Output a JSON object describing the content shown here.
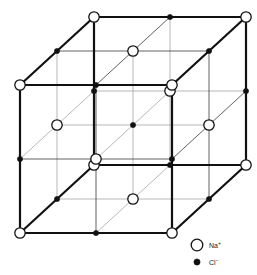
{
  "figure": {
    "background_color": "#ffffff"
  },
  "geometry": {
    "origin_x": 20,
    "origin_y": 233,
    "x_step": 76,
    "y_step": 74,
    "depth_dx": 37,
    "depth_dy": -34,
    "steps": 2
  },
  "style": {
    "outer_edge_color": "#111111",
    "outer_edge_width": 2.2,
    "inner_edge_color": "#3a3a3a",
    "inner_edge_width": 0.8,
    "faint_edge_color": "#9a9a9a",
    "faint_edge_width": 0.7,
    "na_fill": "#ffffff",
    "na_stroke": "#111111",
    "na_radius": 5.2,
    "na_stroke_width": 1.3,
    "cl_fill": "#111111",
    "cl_stroke": "#111111",
    "cl_radius": 2.6
  },
  "ions": {
    "na": {
      "symbol": "Na",
      "charge": "+",
      "label": "Na⁺",
      "name": "sodium-ion",
      "marker": "open-circle"
    },
    "cl": {
      "symbol": "Cl",
      "charge": "−",
      "label": "Cl⁻",
      "name": "chloride-ion",
      "marker": "filled-dot"
    }
  },
  "legend": {
    "position": "bottom-right",
    "items": [
      {
        "marker": "open-circle",
        "symbol": "Na",
        "charge": "+",
        "label": "Na⁺",
        "x": 197,
        "y": 245
      },
      {
        "marker": "filled-dot",
        "symbol": "Cl",
        "charge": "−",
        "label": "Cl⁻",
        "x": 197,
        "y": 262
      }
    ],
    "text_offset_x": 12
  },
  "chart_data": {
    "type": "scatter",
    "xlabel": "",
    "ylabel": "",
    "lattice": {
      "name": "rock-salt (NaCl)",
      "grid": [
        3,
        3,
        3
      ],
      "alternating_rule": "(i+j+k) even = Na+, odd = Cl-",
      "site_count": 27,
      "na_count": 14,
      "cl_count": 13
    },
    "legend_entries": [
      "Na⁺",
      "Cl⁻"
    ],
    "projection": "oblique (cavalier)"
  }
}
